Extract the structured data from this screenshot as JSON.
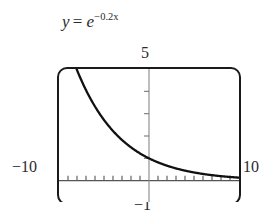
{
  "figure": {
    "name": "graphing-calculator-window",
    "equation": {
      "lhs": "y",
      "relation": "=",
      "base": "e",
      "exponent": "−0.2x",
      "full_text": "y = e^(−0.2x)"
    },
    "labels": {
      "y_max": "5",
      "y_min": "−1",
      "x_min": "−10",
      "x_max": "10"
    },
    "colors": {
      "background": "#ffffff",
      "frame": "#1a1a1a",
      "curve": "#111111",
      "axis": "#6b6b6b",
      "text": "#2b2b2b"
    }
  },
  "chart_data": {
    "type": "line",
    "xlabel": "",
    "ylabel": "",
    "xlim": [
      -10,
      10
    ],
    "ylim": [
      -1,
      5
    ],
    "grid": false,
    "legend": null,
    "axis_tick_labels": {
      "x": [
        "−10",
        "10"
      ],
      "y": [
        "−1",
        "5"
      ]
    },
    "x_tick_step": 1,
    "y_tick_step": 1,
    "series": [
      {
        "name": "y = e^(-0.2x)",
        "formula": "exp(-0.2*x)",
        "x": [
          -10,
          -9.5,
          -9,
          -8.5,
          -8,
          -7.5,
          -7,
          -6.5,
          -6,
          -5.5,
          -5,
          -4.5,
          -4,
          -3.5,
          -3,
          -2.5,
          -2,
          -1.5,
          -1,
          -0.5,
          0,
          0.5,
          1,
          1.5,
          2,
          2.5,
          3,
          3.5,
          4,
          4.5,
          5,
          5.5,
          6,
          6.5,
          7,
          7.5,
          8,
          8.5,
          9,
          9.5,
          10
        ],
        "y": [
          7.389,
          6.686,
          6.05,
          5.474,
          4.953,
          4.482,
          4.055,
          3.669,
          3.32,
          3.004,
          2.718,
          2.46,
          2.226,
          2.014,
          1.822,
          1.649,
          1.492,
          1.35,
          1.221,
          1.105,
          1.0,
          0.905,
          0.819,
          0.741,
          0.67,
          0.607,
          0.549,
          0.497,
          0.449,
          0.407,
          0.368,
          0.333,
          0.301,
          0.272,
          0.247,
          0.223,
          0.202,
          0.183,
          0.165,
          0.15,
          0.135
        ]
      }
    ]
  }
}
